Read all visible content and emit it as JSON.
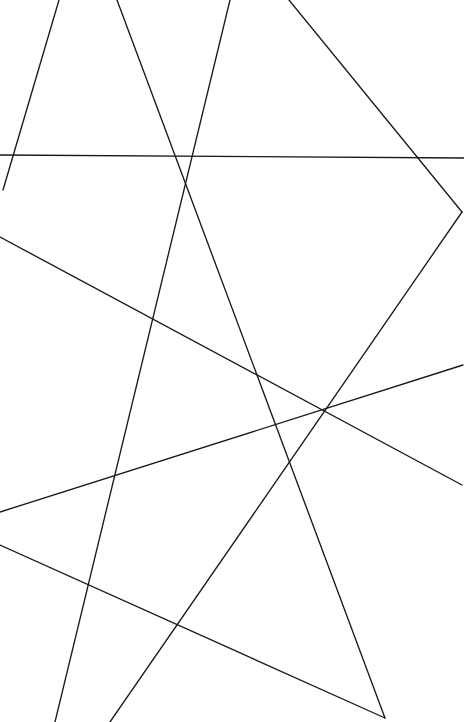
{
  "figure": {
    "type": "line-drawing",
    "width": 464,
    "height": 722,
    "background_color": "#ffffff",
    "stroke_color": "#1a1a1a",
    "stroke_width": 1.35,
    "line_count": 9
  },
  "chart_data": {
    "type": "line",
    "subtitle": "",
    "xlabel": "",
    "ylabel": "",
    "xlim": [
      0,
      464
    ],
    "ylim": [
      0,
      722
    ],
    "grid": false,
    "legend": "none",
    "annotations": [],
    "tick_labels": {
      "x": [],
      "y": []
    },
    "series": [
      {
        "name": "segment-1",
        "description": "short steep segment from top edge down-left to left-interior endpoint",
        "x": [
          59,
          3
        ],
        "y": [
          0,
          190
        ]
      },
      {
        "name": "segment-2",
        "description": "long diagonal from top edge down-right to bottom edge",
        "x": [
          117,
          385
        ],
        "y": [
          0,
          718
        ]
      },
      {
        "name": "segment-3",
        "description": "long diagonal from top edge down-left to bottom edge",
        "x": [
          230,
          55
        ],
        "y": [
          0,
          722
        ]
      },
      {
        "name": "segment-4",
        "description": "diagonal from top edge down-right to right-edge vertex",
        "x": [
          289,
          462
        ],
        "y": [
          0,
          212
        ]
      },
      {
        "name": "segment-5",
        "description": "near-horizontal line spanning left edge to right edge",
        "x": [
          0,
          464
        ],
        "y": [
          155,
          158
        ]
      },
      {
        "name": "segment-6",
        "description": "long gentle diagonal from left edge down to right edge",
        "x": [
          0,
          462
        ],
        "y": [
          237,
          485
        ]
      },
      {
        "name": "segment-7",
        "description": "gentle diagonal rising from lower-left edge to right edge",
        "x": [
          0,
          463
        ],
        "y": [
          512,
          365
        ]
      },
      {
        "name": "segment-8",
        "description": "gentle diagonal falling from left edge to bottom-right endpoint",
        "x": [
          0,
          385
        ],
        "y": [
          545,
          718
        ]
      },
      {
        "name": "segment-9",
        "description": "steep diagonal from bottom edge rising to right-edge vertex",
        "x": [
          110,
          462
        ],
        "y": [
          722,
          212
        ]
      }
    ]
  }
}
